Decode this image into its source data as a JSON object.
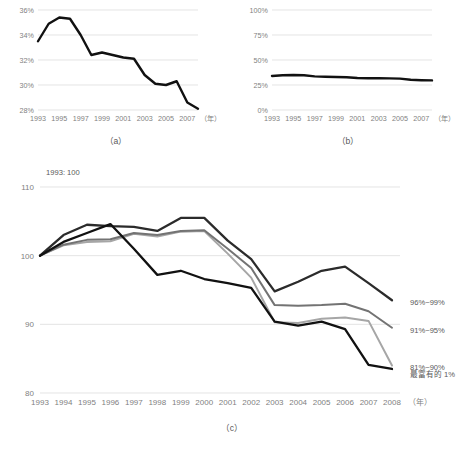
{
  "figure": {
    "captions": {
      "a": "（a）",
      "b": "（b）",
      "c": "（c）"
    },
    "note_c": "1993: 100",
    "axis_unit": "（年）"
  },
  "colors": {
    "series_top1": "#1a1a1a",
    "series_96_99": "#404040",
    "series_91_95": "#737373",
    "series_81_90": "#a6a6a6",
    "gridline": "#d9d9d9",
    "tick_text": "#7f7f7f",
    "label_text": "#595959",
    "background": "#ffffff"
  },
  "chart_data": [
    {
      "id": "a",
      "type": "line",
      "title": "",
      "subtitle": "",
      "xlabel": "（年）",
      "ylabel": "",
      "grid": true,
      "legend": "none",
      "ylim": [
        28,
        36
      ],
      "yticks": [
        28,
        30,
        32,
        34,
        36
      ],
      "ytick_labels": [
        "28%",
        "30%",
        "32%",
        "34%",
        "36%"
      ],
      "xlim": [
        1993,
        2008
      ],
      "xticks": [
        1993,
        1995,
        1997,
        1999,
        2001,
        2003,
        2005,
        2007
      ],
      "xtick_labels": [
        "1993",
        "1995",
        "1997",
        "1999",
        "2001",
        "2003",
        "2005",
        "2007"
      ],
      "x": [
        1993,
        1994,
        1995,
        1996,
        1997,
        1998,
        1999,
        2000,
        2001,
        2002,
        2003,
        2004,
        2005,
        2006,
        2007,
        2008
      ],
      "values": [
        33.5,
        34.9,
        35.4,
        35.3,
        34.0,
        32.4,
        32.6,
        32.4,
        32.2,
        32.1,
        30.8,
        30.1,
        30.0,
        30.3,
        28.6,
        28.1
      ],
      "unit": "%"
    },
    {
      "id": "b",
      "type": "line",
      "title": "",
      "subtitle": "",
      "xlabel": "（年）",
      "ylabel": "",
      "grid": true,
      "legend": "none",
      "ylim": [
        0,
        100
      ],
      "yticks": [
        0,
        25,
        50,
        75,
        100
      ],
      "ytick_labels": [
        "0%",
        "25%",
        "50%",
        "75%",
        "100%"
      ],
      "xlim": [
        1993,
        2008
      ],
      "xticks": [
        1993,
        1995,
        1997,
        1999,
        2001,
        2003,
        2005,
        2007
      ],
      "xtick_labels": [
        "1993",
        "1995",
        "1997",
        "1999",
        "2001",
        "2003",
        "2005",
        "2007"
      ],
      "x": [
        1993,
        1994,
        1995,
        1996,
        1997,
        1998,
        1999,
        2000,
        2001,
        2002,
        2003,
        2004,
        2005,
        2006,
        2007,
        2008
      ],
      "values": [
        34.0,
        34.8,
        35.0,
        34.8,
        33.6,
        33.2,
        33.0,
        32.8,
        32.0,
        31.8,
        31.8,
        31.6,
        31.4,
        30.2,
        29.8,
        29.6
      ],
      "unit": "%"
    },
    {
      "id": "c",
      "type": "line",
      "title": "",
      "subtitle": "1993: 100",
      "xlabel": "（年）",
      "ylabel": "",
      "grid": true,
      "legend": "right",
      "ylim": [
        80,
        110
      ],
      "yticks": [
        80,
        90,
        100,
        110
      ],
      "ytick_labels": [
        "80",
        "90",
        "100",
        "110"
      ],
      "xlim": [
        1993,
        2008
      ],
      "xticks": [
        1993,
        1994,
        1995,
        1996,
        1997,
        1998,
        1999,
        2000,
        2001,
        2002,
        2003,
        2004,
        2005,
        2006,
        2007,
        2008
      ],
      "xtick_labels": [
        "1993",
        "1994",
        "1995",
        "1996",
        "1997",
        "1998",
        "1999",
        "2000",
        "2001",
        "2002",
        "2003",
        "2004",
        "2005",
        "2006",
        "2007",
        "2008"
      ],
      "x": [
        1993,
        1994,
        1995,
        1996,
        1997,
        1998,
        1999,
        2000,
        2001,
        2002,
        2003,
        2004,
        2005,
        2006,
        2007,
        2008
      ],
      "series": [
        {
          "name": "96%~99%",
          "color": "#2b2b2b",
          "values": [
            100.0,
            103.0,
            104.5,
            104.3,
            104.2,
            103.6,
            105.5,
            105.5,
            102.2,
            99.5,
            94.8,
            96.2,
            97.8,
            98.4,
            96.0,
            93.5
          ]
        },
        {
          "name": "91%~95%",
          "color": "#737373",
          "values": [
            100.0,
            101.6,
            102.3,
            102.4,
            103.3,
            103.0,
            103.6,
            103.7,
            101.0,
            98.2,
            92.8,
            92.7,
            92.8,
            93.0,
            91.9,
            89.5
          ]
        },
        {
          "name": "81%~90%",
          "color": "#a6a6a6",
          "values": [
            100.0,
            101.5,
            102.0,
            102.1,
            103.2,
            102.8,
            103.5,
            103.6,
            100.3,
            96.8,
            90.3,
            90.2,
            90.8,
            91.0,
            90.5,
            84.0
          ]
        },
        {
          "name": "最富有的 1%",
          "color": "#111111",
          "values": [
            100.0,
            102.0,
            103.3,
            104.6,
            101.0,
            97.2,
            97.8,
            96.6,
            96.0,
            95.3,
            90.4,
            89.8,
            90.4,
            89.3,
            84.1,
            83.5
          ]
        }
      ]
    }
  ]
}
